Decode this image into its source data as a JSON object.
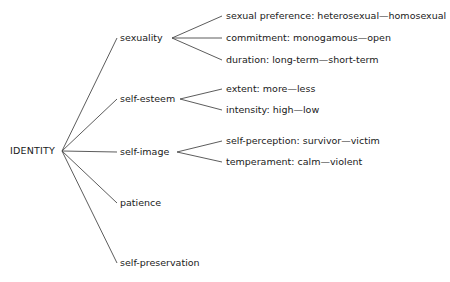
{
  "diagram": {
    "type": "tree",
    "title": "IDENTITY",
    "background_color": "#ffffff",
    "line_color": "#4a4a4a",
    "text_color": "#1a1a1a",
    "root": {
      "label": "IDENTITY",
      "x": 10,
      "y": 151
    },
    "branches": [
      {
        "label": "sexuality",
        "x": 120,
        "y": 38,
        "fan_x": 172,
        "leaf_start_x": 222,
        "leaves": [
          {
            "label": "sexual preference: heterosexual—homosexual",
            "x": 226,
            "y": 16
          },
          {
            "label": "commitment: monogamous—open",
            "x": 226,
            "y": 38
          },
          {
            "label": "duration: long-term—short-term",
            "x": 226,
            "y": 60
          }
        ]
      },
      {
        "label": "self-esteem",
        "x": 120,
        "y": 99,
        "fan_x": 180,
        "leaf_start_x": 222,
        "leaves": [
          {
            "label": "extent: more—less",
            "x": 226,
            "y": 89
          },
          {
            "label": "intensity: high—low",
            "x": 226,
            "y": 110
          }
        ]
      },
      {
        "label": "self-image",
        "x": 120,
        "y": 152,
        "fan_x": 177,
        "leaf_start_x": 222,
        "leaves": [
          {
            "label": "self-perception: survivor—victim",
            "x": 226,
            "y": 141
          },
          {
            "label": "temperament: calm—violent",
            "x": 226,
            "y": 162
          }
        ]
      },
      {
        "label": "patience",
        "x": 120,
        "y": 203,
        "fan_x": null,
        "leaf_start_x": null,
        "leaves": []
      },
      {
        "label": "self-preservation",
        "x": 120,
        "y": 263,
        "fan_x": null,
        "leaf_start_x": null,
        "leaves": []
      }
    ]
  }
}
